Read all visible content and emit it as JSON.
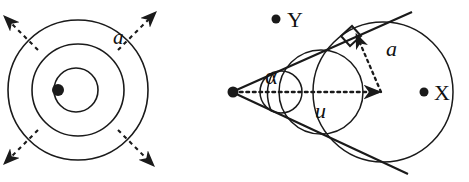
{
  "figure": {
    "name": "two-panel-geometry-figure",
    "background": "#ffffff",
    "stroke": "#1a1a1a",
    "width": 469,
    "height": 182,
    "panels": [
      {
        "id": "left-panel",
        "name": "concentric-circles-with-radial-arrows",
        "center": {
          "x": 78,
          "y": 90
        },
        "center_dot_offset": {
          "x": -20,
          "y": 0
        },
        "circles": [
          {
            "name": "inner-circle",
            "r": 22
          },
          {
            "name": "middle-circle",
            "r": 46
          },
          {
            "name": "outer-circle",
            "r": 70
          }
        ],
        "arrows": [
          {
            "name": "arrow-up-left",
            "angle_deg": 218,
            "dashed": true
          },
          {
            "name": "arrow-up-right",
            "angle_deg": 322,
            "dashed": true
          },
          {
            "name": "arrow-down-left",
            "angle_deg": 142,
            "dashed": true
          },
          {
            "name": "arrow-down-right",
            "angle_deg": 38,
            "dashed": true
          }
        ],
        "labels": [
          {
            "name": "label-a-left",
            "text": "a",
            "italic": true,
            "x": 113,
            "y": 44,
            "size": 21
          }
        ]
      },
      {
        "id": "right-panel",
        "name": "tangent-cone-with-circles",
        "apex": {
          "x": 232,
          "y": 92
        },
        "tangent_lines": [
          {
            "name": "upper-tangent-line",
            "x1": 232,
            "y1": 92,
            "x2": 410,
            "y2": 13
          },
          {
            "name": "lower-tangent-line",
            "x1": 232,
            "y1": 92,
            "x2": 406,
            "y2": 172
          }
        ],
        "circles": [
          {
            "name": "small-inscribed-circle",
            "cx": 281,
            "cy": 92,
            "r": 21
          },
          {
            "name": "medium-inscribed-circle",
            "cx": 321,
            "cy": 92,
            "r": 42
          },
          {
            "name": "large-inscribed-circle",
            "cx": 383,
            "cy": 92,
            "r": 70
          }
        ],
        "axis": {
          "name": "axis-dotted-arrow",
          "x1": 238,
          "y1": 92,
          "x2": 381,
          "y2": 92,
          "dotted": true
        },
        "radius_segment": {
          "name": "radius-a-dotted-arrow",
          "x1": 381,
          "y1": 92,
          "x2": 356,
          "y2": 37,
          "dotted": true
        },
        "right_angle_marker": {
          "name": "right-angle-marker",
          "x": 352,
          "y": 33,
          "size": 13
        },
        "angle_arc": {
          "name": "angle-alpha-arc",
          "cx": 232,
          "cy": 92,
          "r": 44
        },
        "labels": [
          {
            "name": "label-a-right",
            "text": "a",
            "italic": true,
            "x": 388,
            "y": 55,
            "size": 22
          },
          {
            "name": "label-alpha",
            "text": "α",
            "italic": false,
            "x": 267,
            "y": 82,
            "size": 22
          },
          {
            "name": "label-u",
            "text": "u",
            "italic": true,
            "x": 317,
            "y": 117,
            "size": 22
          },
          {
            "name": "label-x",
            "text": "X",
            "italic": false,
            "x": 437,
            "y": 98,
            "size": 22
          },
          {
            "name": "label-y",
            "text": "Y",
            "italic": false,
            "x": 290,
            "y": 26,
            "size": 22
          }
        ],
        "points": [
          {
            "name": "point-x-dot",
            "cx": 424,
            "cy": 92,
            "r": 4.5
          },
          {
            "name": "point-y-dot",
            "cx": 276,
            "cy": 19,
            "r": 4.5
          },
          {
            "name": "apex-dot",
            "cx": 233,
            "cy": 92,
            "r": 5.5
          }
        ]
      }
    ]
  }
}
